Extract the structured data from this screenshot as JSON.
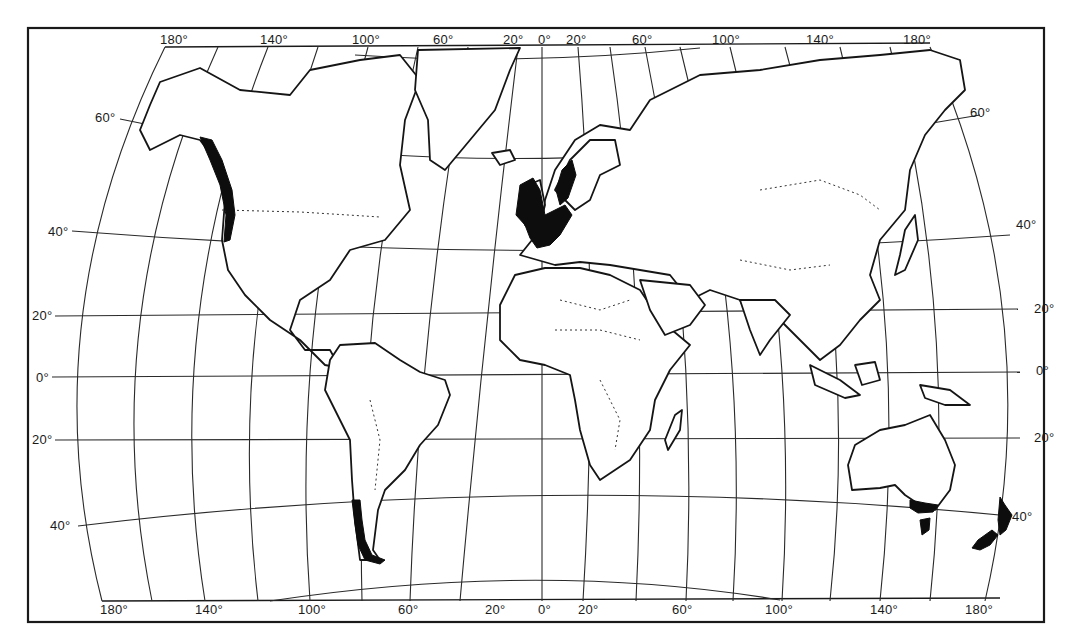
{
  "map": {
    "title": "",
    "projection_style": "world map with curved meridians",
    "colors": {
      "ink": "#151515",
      "shaded_region": "#0d0d0d",
      "background": "#ffffff"
    },
    "top_longitude_labels": [
      "180°",
      "140°",
      "100°",
      "60°",
      "20°",
      "0°",
      "20°",
      "60°",
      "100°",
      "140°",
      "180°"
    ],
    "bottom_longitude_labels": [
      "180°",
      "140°",
      "100°",
      "60°",
      "20°",
      "0°",
      "20°",
      "60°",
      "100°",
      "140°",
      "180°"
    ],
    "left_latitude_labels": [
      "60°",
      "40°",
      "20°",
      "0°",
      "20°",
      "40°"
    ],
    "right_latitude_labels": [
      "60°",
      "40°",
      "20°",
      "0°",
      "20°",
      "40°"
    ],
    "shaded_regions": [
      "Pacific Northwest coast of North America",
      "British Isles, France, Low Countries and Norwegian coast",
      "Southern Chile",
      "Southeastern Australia and Tasmania",
      "New Zealand"
    ]
  }
}
